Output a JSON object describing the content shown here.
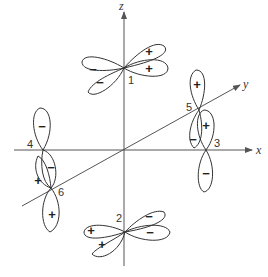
{
  "figure": {
    "axes": {
      "x": {
        "label": "x"
      },
      "y": {
        "label": "y"
      },
      "z": {
        "label": "z"
      }
    },
    "orbitals": [
      {
        "id": "1",
        "label": "1",
        "lobes": [
          "+",
          "+",
          "−",
          "−"
        ]
      },
      {
        "id": "2",
        "label": "2",
        "lobes": [
          "−",
          "−",
          "+",
          "+"
        ]
      },
      {
        "id": "3",
        "label": "3",
        "lobes": [
          "+",
          "−"
        ]
      },
      {
        "id": "4",
        "label": "4",
        "lobes": [
          "−",
          "−"
        ]
      },
      {
        "id": "5",
        "label": "5",
        "lobes": [
          "+",
          "−"
        ]
      },
      {
        "id": "6",
        "label": "6",
        "lobes": [
          "+",
          "+"
        ]
      }
    ],
    "colors": {
      "line": "#333333",
      "axis": "#555555",
      "background": "#ffffff"
    }
  }
}
